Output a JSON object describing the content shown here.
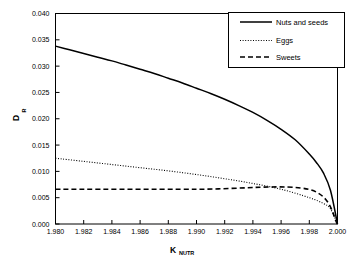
{
  "chart_data": {
    "type": "line",
    "title": "",
    "subtitle": "",
    "xlabel": "K",
    "xlabel_sub": "NUTR",
    "ylabel": "D",
    "ylabel_sub": "R",
    "xlim": [
      1.98,
      2.0
    ],
    "ylim": [
      0.0,
      0.04
    ],
    "grid": false,
    "legend_position": "top-right",
    "xticks": [
      "1.980",
      "1.982",
      "1.984",
      "1.986",
      "1.988",
      "1.990",
      "1.992",
      "1.994",
      "1.996",
      "1.998",
      "2.000"
    ],
    "xtick_values": [
      1.98,
      1.982,
      1.984,
      1.986,
      1.988,
      1.99,
      1.992,
      1.994,
      1.996,
      1.998,
      2.0
    ],
    "yticks": [
      "0.000",
      "0.005",
      "0.010",
      "0.015",
      "0.020",
      "0.025",
      "0.030",
      "0.035",
      "0.040"
    ],
    "ytick_values": [
      0.0,
      0.005,
      0.01,
      0.015,
      0.02,
      0.025,
      0.03,
      0.035,
      0.04
    ],
    "series": [
      {
        "name": "Nuts and seeds",
        "style": "solid",
        "color": "#000000",
        "x": [
          1.98,
          1.981,
          1.982,
          1.983,
          1.984,
          1.985,
          1.986,
          1.987,
          1.988,
          1.989,
          1.99,
          1.991,
          1.992,
          1.993,
          1.994,
          1.995,
          1.996,
          1.997,
          1.998,
          1.9985,
          1.999,
          1.9995,
          2.0
        ],
        "values": [
          0.0338,
          0.0331,
          0.0324,
          0.0317,
          0.031,
          0.0302,
          0.0294,
          0.0286,
          0.0277,
          0.0268,
          0.0258,
          0.0248,
          0.0237,
          0.0225,
          0.0212,
          0.0197,
          0.018,
          0.016,
          0.0133,
          0.0117,
          0.0097,
          0.0064,
          0.0
        ]
      },
      {
        "name": "Eggs",
        "style": "dotted",
        "color": "#000000",
        "x": [
          1.98,
          1.982,
          1.984,
          1.986,
          1.988,
          1.99,
          1.992,
          1.994,
          1.996,
          1.998,
          1.999,
          1.9995,
          2.0
        ],
        "values": [
          0.0125,
          0.0119,
          0.0113,
          0.0107,
          0.0101,
          0.0094,
          0.0086,
          0.0077,
          0.0066,
          0.005,
          0.0039,
          0.0029,
          0.0
        ]
      },
      {
        "name": "Sweets",
        "style": "dashed",
        "color": "#000000",
        "x": [
          1.98,
          1.99,
          1.998,
          2.0
        ],
        "values": [
          0.0066,
          0.0066,
          0.00655,
          0.0
        ]
      }
    ],
    "annotations": []
  },
  "legend": {
    "entries": [
      {
        "label": "Nuts and seeds"
      },
      {
        "label": "Eggs"
      },
      {
        "label": "Sweets"
      }
    ]
  }
}
